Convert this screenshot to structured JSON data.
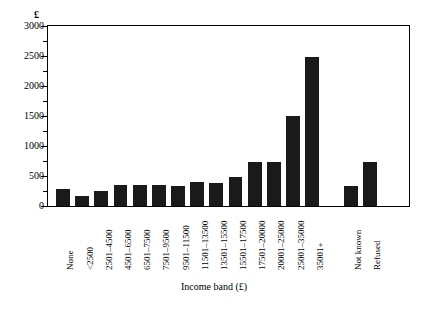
{
  "chart_data": {
    "type": "bar",
    "title": "",
    "subtitle": "",
    "xlabel": "Income band (£)",
    "ylabel": "£",
    "ylim": [
      0,
      3000
    ],
    "ytick_step": 500,
    "yminor_step": 250,
    "grid": false,
    "legend": null,
    "bar_color": "#1a1a1a",
    "categories": [
      "None",
      "<2500",
      "2501–4500",
      "4501–6500",
      "6501–7500",
      "7501–9500",
      "9501–11500",
      "11501–13500",
      "13501–15500",
      "15501–17500",
      "17501–20000",
      "20001–25000",
      "25001–35000",
      "35001+",
      "",
      "Not known",
      "Refused"
    ],
    "values": [
      290,
      160,
      255,
      350,
      350,
      345,
      340,
      400,
      385,
      490,
      735,
      735,
      1495,
      2485,
      null,
      340,
      735
    ],
    "ytick_labels": [
      "0",
      "500",
      "1000",
      "1500",
      "2000",
      "2500",
      "3000"
    ],
    "ytick_values": [
      0,
      500,
      1000,
      1500,
      2000,
      2500,
      3000
    ],
    "yminor_values": [
      250,
      750,
      1250,
      1750,
      2250,
      2750
    ]
  }
}
